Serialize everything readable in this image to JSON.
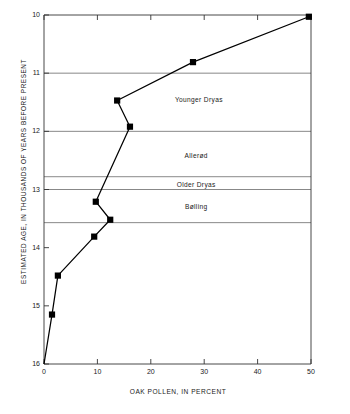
{
  "chart_data": {
    "type": "line",
    "title": "",
    "xlabel": "OAK POLLEN, IN PERCENT",
    "ylabel": "ESTIMATED AGE, IN THOUSANDS OF YEARS BEFORE PRESENT",
    "xlim": [
      0,
      50
    ],
    "ylim": [
      16,
      10
    ],
    "y_axis_inverted": true,
    "grid": "horizontal",
    "legend": "none",
    "xticks": [
      0,
      10,
      20,
      30,
      40,
      50
    ],
    "xtick_labels": [
      "0",
      "10",
      "20",
      "30",
      "40",
      "50"
    ],
    "yticks": [
      10,
      11,
      12,
      13,
      14,
      15,
      16
    ],
    "ytick_labels": [
      "10",
      "11",
      "12",
      "13",
      "14",
      "15",
      "16"
    ],
    "marker": "filled-square",
    "series": [
      {
        "name": "Oak pollen",
        "x": [
          0.0,
          1.5,
          2.6,
          9.4,
          12.4,
          9.7,
          16.1,
          13.7,
          27.9,
          49.6
        ],
        "y": [
          16.0,
          15.15,
          14.48,
          13.81,
          13.52,
          13.21,
          11.92,
          11.47,
          10.81,
          10.03
        ],
        "points": [
          {
            "x": 0.0,
            "y": 16.0,
            "marker": false
          },
          {
            "x": 1.5,
            "y": 15.15,
            "marker": true
          },
          {
            "x": 2.6,
            "y": 14.48,
            "marker": true
          },
          {
            "x": 9.4,
            "y": 13.81,
            "marker": true
          },
          {
            "x": 12.4,
            "y": 13.52,
            "marker": true
          },
          {
            "x": 9.7,
            "y": 13.21,
            "marker": true
          },
          {
            "x": 16.1,
            "y": 11.92,
            "marker": true
          },
          {
            "x": 13.7,
            "y": 11.47,
            "marker": true
          },
          {
            "x": 27.9,
            "y": 10.81,
            "marker": true
          },
          {
            "x": 49.6,
            "y": 10.03,
            "marker": true
          }
        ]
      }
    ],
    "gridlines": [
      {
        "y": 11.0
      },
      {
        "y": 12.0
      },
      {
        "y": 12.78
      },
      {
        "y": 13.0
      },
      {
        "y": 13.57
      }
    ],
    "annotations": [
      {
        "label": "Younger Dryas",
        "x": 29.0,
        "y": 11.45
      },
      {
        "label": "Allerød",
        "x": 28.5,
        "y": 12.4
      },
      {
        "label": "Older Dryas",
        "x": 28.5,
        "y": 12.91
      },
      {
        "label": "Bølling",
        "x": 28.5,
        "y": 13.28
      }
    ],
    "colors": {
      "line": "#000000",
      "marker": "#000000",
      "axis": "#333333",
      "grid": "#555555",
      "background": "#ffffff",
      "text": "#1a1a1a"
    }
  }
}
